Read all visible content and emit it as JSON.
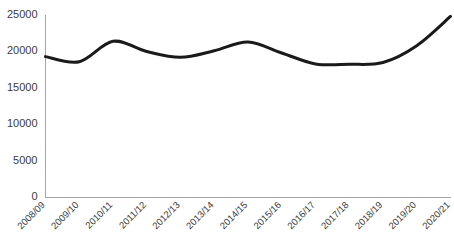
{
  "chart_data": {
    "type": "line",
    "title": "",
    "subtitle": "",
    "xlabel": "",
    "ylabel": "",
    "categories": [
      "2008/09",
      "2009/10",
      "2010/11",
      "2011/12",
      "2012/13",
      "2013/14",
      "2014/15",
      "2015/16",
      "2016/17",
      "2017/18",
      "2018/19",
      "2019/20",
      "2020/21"
    ],
    "values": [
      19300,
      18600,
      21400,
      20000,
      19200,
      20100,
      21300,
      19800,
      18300,
      18250,
      18500,
      20800,
      24800
    ],
    "series": [
      {
        "name": "series-1",
        "values": [
          19300,
          18600,
          21400,
          20000,
          19200,
          20100,
          21300,
          19800,
          18300,
          18250,
          18500,
          20800,
          24800
        ],
        "color": "#1a1a1a",
        "line_width": 3,
        "smooth": true
      }
    ],
    "ylim": [
      0,
      25000
    ],
    "ytick_values": [
      0,
      5000,
      10000,
      15000,
      20000,
      25000
    ],
    "ytick_labels": [
      "0",
      "5000",
      "10000",
      "15000",
      "20000",
      "25000"
    ],
    "grid": false,
    "legend": false,
    "legend_position": "none",
    "xtick_rotation": 45,
    "axis_color": "#a6a6a6",
    "background_color": "#ffffff",
    "text_color": "#3b3b3b"
  },
  "axes": {
    "y_axis_name": "value-axis",
    "x_axis_name": "period-axis"
  }
}
